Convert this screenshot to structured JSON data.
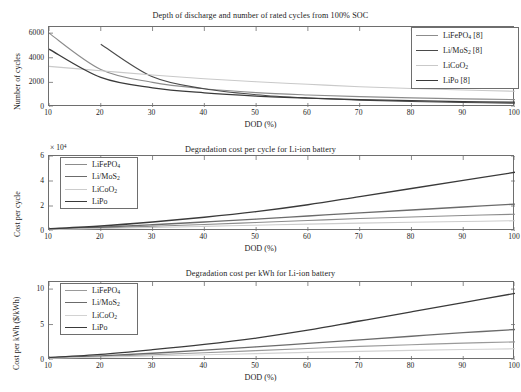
{
  "figure": {
    "xlabel": "DOD (%)",
    "xticks": [
      "10",
      "20",
      "30",
      "40",
      "50",
      "60",
      "70",
      "80",
      "90",
      "100"
    ]
  },
  "panel1": {
    "title": "Depth of discharge and number of rated cycles from 100% SOC",
    "ylabel": "Number of cycles",
    "yticks": [
      "0",
      "2000",
      "4000",
      "6000"
    ],
    "legend": [
      {
        "label": "LiFePO4 [8]",
        "html": "LiFePO<sub>4</sub> [8]",
        "color": "#8c8c8c",
        "width": 1.1
      },
      {
        "label": "Li/MoS2 [8]",
        "html": "Li/MoS<sub>2</sub> [8]",
        "color": "#4a4a4a",
        "width": 1.1
      },
      {
        "label": "LiCoO2",
        "html": "LiCoO<sub>2</sub>",
        "color": "#c9c9c9",
        "width": 1.1
      },
      {
        "label": "LiPo [8]",
        "html": "LiPo [8]",
        "color": "#3a3a3a",
        "width": 1.3
      }
    ]
  },
  "panel2": {
    "title": "Degradation cost per cycle for Li-ion battery",
    "ylabel": "Cost per cycle",
    "exponent": "× 10",
    "exponent_power": "4",
    "yticks": [
      "0",
      "2",
      "4",
      "6"
    ],
    "legend": [
      {
        "label": "LiFePO4",
        "html": "LiFePO<sub>4</sub>",
        "color": "#8c8c8c",
        "width": 1.1
      },
      {
        "label": "Li/MoS2",
        "html": "Li/MoS<sub>2</sub>",
        "color": "#6b6b6b",
        "width": 1.3
      },
      {
        "label": "LiCoO2",
        "html": "LiCoO<sub>2</sub>",
        "color": "#cccccc",
        "width": 1.1
      },
      {
        "label": "LiPo",
        "html": "LiPo",
        "color": "#3a3a3a",
        "width": 1.3
      }
    ]
  },
  "panel3": {
    "title": "Degradation cost per kWh for Li-ion battery",
    "ylabel": "Cost per kWh ($/kWh)",
    "yticks": [
      "0",
      "5",
      "10"
    ],
    "legend": [
      {
        "label": "LiFePO4",
        "html": "LiFePO<sub>4</sub>",
        "color": "#9a9a9a",
        "width": 1.1
      },
      {
        "label": "Li/MoS2",
        "html": "Li/MoS<sub>2</sub>",
        "color": "#6b6b6b",
        "width": 1.3
      },
      {
        "label": "LiCoO2",
        "html": "LiCoO<sub>2</sub>",
        "color": "#d2d2d2",
        "width": 1.1
      },
      {
        "label": "LiPo",
        "html": "LiPo",
        "color": "#3a3a3a",
        "width": 1.3
      }
    ]
  },
  "chart_data": [
    {
      "type": "line",
      "title": "Depth of discharge and number of rated cycles from 100% SOC",
      "xlabel": "DOD (%)",
      "ylabel": "Number of cycles",
      "xlim": [
        10,
        100
      ],
      "ylim": [
        0,
        6500
      ],
      "xticks": [
        10,
        20,
        30,
        40,
        50,
        60,
        70,
        80,
        90,
        100
      ],
      "yticks": [
        0,
        2000,
        4000,
        6000
      ],
      "grid": false,
      "legend_position": "top-right",
      "x": [
        10,
        20,
        30,
        40,
        50,
        60,
        70,
        80,
        90,
        100
      ],
      "series": [
        {
          "name": "LiFePO4 [8]",
          "values": [
            6000,
            3050,
            2000,
            1480,
            1170,
            980,
            840,
            740,
            660,
            600
          ]
        },
        {
          "name": "Li/MoS2 [8]",
          "values": [
            null,
            5100,
            2450,
            1480,
            1000,
            730,
            560,
            450,
            370,
            310
          ]
        },
        {
          "name": "LiCoO2",
          "values": [
            3300,
            2950,
            2600,
            2300,
            2050,
            1850,
            1650,
            1500,
            1380,
            1280
          ]
        },
        {
          "name": "LiPo [8]",
          "values": [
            4700,
            2400,
            1560,
            1150,
            890,
            720,
            600,
            510,
            440,
            390
          ]
        }
      ]
    },
    {
      "type": "line",
      "title": "Degradation cost per cycle for Li-ion battery",
      "xlabel": "DOD (%)",
      "ylabel": "Cost per cycle",
      "y_exponent": "x 10^4",
      "xlim": [
        10,
        100
      ],
      "ylim": [
        0,
        6
      ],
      "xticks": [
        10,
        20,
        30,
        40,
        50,
        60,
        70,
        80,
        90,
        100
      ],
      "yticks": [
        0,
        2,
        4,
        6
      ],
      "grid": false,
      "legend_position": "top-left",
      "x": [
        10,
        20,
        30,
        40,
        50,
        60,
        70,
        80,
        90,
        100
      ],
      "series": [
        {
          "name": "LiFePO4",
          "values": [
            0.15,
            0.25,
            0.38,
            0.52,
            0.68,
            0.84,
            1.0,
            1.12,
            1.24,
            1.34
          ]
        },
        {
          "name": "Li/MoS2",
          "values": [
            0.15,
            0.3,
            0.5,
            0.72,
            0.95,
            1.2,
            1.45,
            1.68,
            1.92,
            2.15
          ]
        },
        {
          "name": "LiCoO2",
          "values": [
            0.12,
            0.2,
            0.28,
            0.37,
            0.46,
            0.55,
            0.63,
            0.7,
            0.76,
            0.82
          ]
        },
        {
          "name": "LiPo",
          "values": [
            0.18,
            0.4,
            0.72,
            1.1,
            1.55,
            2.1,
            2.75,
            3.4,
            4.05,
            4.7
          ]
        }
      ]
    },
    {
      "type": "line",
      "title": "Degradation cost per kWh for Li-ion battery",
      "xlabel": "DOD (%)",
      "ylabel": "Cost per kWh ($/kWh)",
      "xlim": [
        10,
        100
      ],
      "ylim": [
        0,
        11
      ],
      "xticks": [
        10,
        20,
        30,
        40,
        50,
        60,
        70,
        80,
        90,
        100
      ],
      "yticks": [
        0,
        5,
        10
      ],
      "grid": false,
      "legend_position": "top-left",
      "x": [
        10,
        20,
        30,
        40,
        50,
        60,
        70,
        80,
        90,
        100
      ],
      "series": [
        {
          "name": "LiFePO4",
          "values": [
            0.3,
            0.5,
            0.75,
            1.02,
            1.32,
            1.62,
            1.92,
            2.15,
            2.38,
            2.55
          ]
        },
        {
          "name": "Li/MoS2",
          "values": [
            0.3,
            0.58,
            0.95,
            1.38,
            1.85,
            2.35,
            2.85,
            3.35,
            3.85,
            4.3
          ]
        },
        {
          "name": "LiCoO2",
          "values": [
            0.25,
            0.4,
            0.56,
            0.73,
            0.9,
            1.07,
            1.22,
            1.36,
            1.48,
            1.58
          ]
        },
        {
          "name": "LiPo",
          "values": [
            0.35,
            0.8,
            1.45,
            2.2,
            3.1,
            4.2,
            5.5,
            6.8,
            8.1,
            9.4
          ]
        }
      ]
    }
  ]
}
